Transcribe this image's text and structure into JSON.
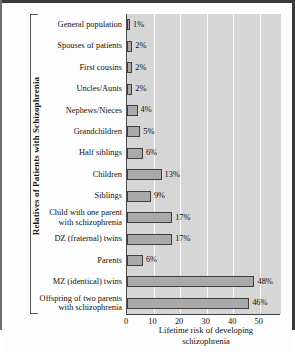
{
  "figure": {
    "background_color": "#fdfdfd",
    "plot_background_color": "#d6d6d6",
    "bar_fill_color": "#a9a9a9",
    "bar_border_color": "#3f3f3f",
    "gridline_color": "#fafafa",
    "axis_color": "#3d3d3d"
  },
  "chart_data": {
    "type": "bar",
    "orientation": "horizontal",
    "title": "",
    "xlabel": "Lifetime risk of developing\nschizophrenia",
    "ylabel": "Relatives of Patients with Schizophrenia",
    "xlim": [
      0,
      58
    ],
    "ylim": null,
    "grid": true,
    "legend": null,
    "xticks": [
      0,
      10,
      20,
      30,
      40,
      50
    ],
    "xtick_labels": [
      "0",
      "10",
      "20",
      "30",
      "40",
      "50"
    ],
    "categories": [
      "General population",
      "Spouses of patients",
      "First cousins",
      "Uncles/Aunts",
      "Nephews/Nieces",
      "Grandchildren",
      "Half siblings",
      "Children",
      "Siblings",
      "Child with one parent\nwith schizophrenia",
      "DZ (fraternal) twins",
      "Parents",
      "MZ (identical) twins",
      "Offspring of two parents\nwith schizophrenia"
    ],
    "values": [
      1,
      2,
      2,
      2,
      4,
      5,
      6,
      13,
      9,
      17,
      17,
      6,
      48,
      46
    ],
    "data_labels": [
      "1%",
      "2%",
      "2%",
      "2%",
      "4%",
      "5%",
      "6%",
      "13%",
      "9%",
      "17%",
      "17%",
      "6%",
      "48%",
      "46%"
    ],
    "units": "percent"
  }
}
